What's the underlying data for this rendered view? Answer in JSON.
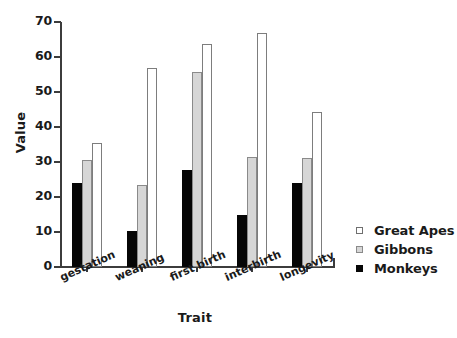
{
  "chart_data": {
    "type": "bar",
    "title": "",
    "subtitle": "",
    "xlabel": "Trait",
    "ylabel": "Value",
    "categories": [
      "gestation",
      "weaning",
      "first birth",
      "interbirth",
      "longevity"
    ],
    "series": [
      {
        "name": "Great Apes",
        "color": "#ffffff",
        "values": [
          35.5,
          57.0,
          63.8,
          67.0,
          44.2
        ]
      },
      {
        "name": "Gibbons",
        "color": "#d6d6d6",
        "values": [
          30.6,
          23.3,
          55.7,
          31.4,
          31.1
        ]
      },
      {
        "name": "Monkeys",
        "color": "#060606",
        "values": [
          24.0,
          10.3,
          27.7,
          15.0,
          24.0
        ]
      }
    ],
    "series_order_drawn": [
      "Monkeys",
      "Gibbons",
      "Great Apes"
    ],
    "ylim": [
      0,
      70
    ],
    "yticks": [
      0,
      10,
      20,
      30,
      40,
      50,
      60,
      70
    ],
    "ytick_labels": [
      "0",
      "10",
      "20",
      "30",
      "40",
      "50",
      "60",
      "70"
    ],
    "grid": false,
    "legend_position": "right",
    "category_label_rotation_degrees": -24
  },
  "axes": {
    "y_title": "Value",
    "x_title": "Trait"
  },
  "legend": {
    "entries": [
      {
        "label": "Great Apes",
        "swatch": "open-square-white"
      },
      {
        "label": "Gibbons",
        "swatch": "filled-square-gray"
      },
      {
        "label": "Monkeys",
        "swatch": "filled-square-black"
      }
    ]
  }
}
